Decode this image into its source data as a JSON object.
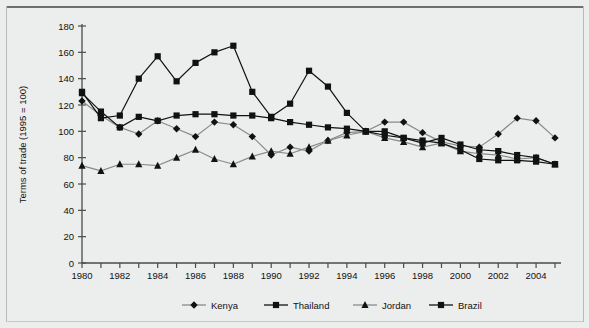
{
  "figure": {
    "background_color": "#eceded",
    "frame_color": "#6e6e6e"
  },
  "chart_data": {
    "type": "line",
    "title": "",
    "xlabel": "",
    "ylabel": "Terms of trade (1995 = 100)",
    "xlim": [
      1980,
      2005
    ],
    "ylim": [
      0,
      180
    ],
    "ytick_step": 20,
    "xtick_step": 1,
    "grid": false,
    "legend_position": "bottom",
    "yticks": [
      0,
      20,
      40,
      60,
      80,
      100,
      120,
      140,
      160,
      180
    ],
    "ytick_labels": [
      "0",
      "20",
      "40",
      "60",
      "80",
      "100",
      "120",
      "140",
      "160",
      "180"
    ],
    "x": [
      1980,
      1981,
      1982,
      1983,
      1984,
      1985,
      1986,
      1987,
      1988,
      1989,
      1990,
      1991,
      1992,
      1993,
      1994,
      1995,
      1996,
      1997,
      1998,
      1999,
      2000,
      2001,
      2002,
      2003,
      2004,
      2005
    ],
    "xtick_labels": [
      "1980",
      "",
      "1982",
      "",
      "1984",
      "",
      "1986",
      "",
      "1988",
      "",
      "1990",
      "",
      "1992",
      "",
      "1994",
      "",
      "1996",
      "",
      "1998",
      "",
      "2000",
      "",
      "2002",
      "",
      "2004",
      ""
    ],
    "xtick_labels_shown": [
      "1980",
      "1982",
      "1984",
      "1986",
      "1988",
      "1990",
      "1992",
      "1994",
      "1996",
      "1998",
      "2000",
      "2002",
      "2004"
    ],
    "series": [
      {
        "name": "Kenya",
        "marker": "diamond",
        "line_color": "#8a8a8a",
        "marker_color": "#111111",
        "values": [
          123,
          112,
          103,
          98,
          108,
          102,
          96,
          107,
          105,
          96,
          82,
          88,
          85,
          93,
          99,
          100,
          107,
          107,
          99,
          92,
          89,
          88,
          98,
          110,
          108,
          95
        ]
      },
      {
        "name": "Thailand",
        "marker": "square",
        "line_color": "#111111",
        "marker_color": "#111111",
        "values": [
          129,
          115,
          103,
          111,
          108,
          112,
          113,
          113,
          112,
          112,
          110,
          107,
          105,
          103,
          102,
          100,
          97,
          95,
          93,
          91,
          86,
          79,
          78,
          78,
          77,
          75
        ]
      },
      {
        "name": "Jordan",
        "marker": "triangle",
        "line_color": "#8a8a8a",
        "marker_color": "#111111",
        "values": [
          74,
          70,
          75,
          75,
          74,
          80,
          86,
          79,
          75,
          81,
          85,
          83,
          88,
          93,
          97,
          100,
          95,
          92,
          88,
          91,
          85,
          83,
          82,
          79,
          80,
          75
        ]
      },
      {
        "name": "Brazil",
        "marker": "square",
        "line_color": "#111111",
        "marker_color": "#111111",
        "values": [
          130,
          110,
          112,
          140,
          157,
          138,
          152,
          160,
          165,
          130,
          111,
          121,
          146,
          134,
          114,
          100,
          100,
          95,
          91,
          95,
          90,
          86,
          85,
          82,
          80,
          75
        ]
      }
    ]
  },
  "legend": {
    "items": [
      {
        "label": "Kenya",
        "marker": "diamond",
        "line_color": "#8a8a8a"
      },
      {
        "label": "Thailand",
        "marker": "square",
        "line_color": "#111111"
      },
      {
        "label": "Jordan",
        "marker": "triangle",
        "line_color": "#8a8a8a"
      },
      {
        "label": "Brazil",
        "marker": "square",
        "line_color": "#111111"
      }
    ]
  }
}
